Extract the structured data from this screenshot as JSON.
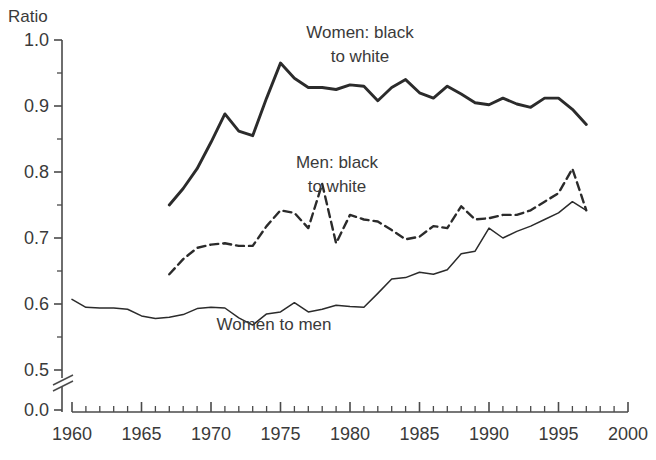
{
  "chart_data": {
    "type": "line",
    "title": "",
    "subtitle": "",
    "xlabel": "",
    "ylabel": "Ratio",
    "xlim": [
      1960,
      2000
    ],
    "ylim": [
      0.5,
      1.0
    ],
    "y_axis_break": true,
    "y_break_below": 0.5,
    "y_origin_label": "0.0",
    "grid": false,
    "legend_position": "inline-annotations",
    "y_ticks": [
      "1.0",
      "0.9",
      "0.8",
      "0.7",
      "0.6",
      "0.5",
      "0.0"
    ],
    "y_tick_values": [
      1.0,
      0.9,
      0.8,
      0.7,
      0.6,
      0.5,
      0.0
    ],
    "y_minor_tick_values": [
      0.95,
      0.85,
      0.75,
      0.65,
      0.55
    ],
    "x_ticks": [
      "1960",
      "1965",
      "1970",
      "1975",
      "1980",
      "1985",
      "1990",
      "1995",
      "2000"
    ],
    "x_tick_values": [
      1960,
      1965,
      1970,
      1975,
      1980,
      1985,
      1990,
      1995,
      2000
    ],
    "x_minor_tick_step": 1,
    "series": [
      {
        "name": "Women: black to white",
        "style": "solid-thick",
        "color": "#2b2b2b",
        "label_line1": "Women: black",
        "label_line2": "to white",
        "x": [
          1967,
          1968,
          1969,
          1970,
          1971,
          1972,
          1973,
          1974,
          1975,
          1976,
          1977,
          1978,
          1979,
          1980,
          1981,
          1982,
          1983,
          1984,
          1985,
          1986,
          1987,
          1988,
          1989,
          1990,
          1991,
          1992,
          1993,
          1994,
          1995,
          1996,
          1997
        ],
        "values": [
          0.75,
          0.775,
          0.805,
          0.845,
          0.888,
          0.862,
          0.855,
          0.912,
          0.965,
          0.942,
          0.928,
          0.928,
          0.925,
          0.932,
          0.93,
          0.908,
          0.928,
          0.94,
          0.92,
          0.912,
          0.93,
          0.918,
          0.905,
          0.902,
          0.912,
          0.903,
          0.898,
          0.912,
          0.912,
          0.895,
          0.872
        ]
      },
      {
        "name": "Men: black to white",
        "style": "dashed",
        "color": "#2b2b2b",
        "label_line1": "Men: black",
        "label_line2": "to white",
        "x": [
          1967,
          1968,
          1969,
          1970,
          1971,
          1972,
          1973,
          1974,
          1975,
          1976,
          1977,
          1978,
          1979,
          1980,
          1981,
          1982,
          1983,
          1984,
          1985,
          1986,
          1987,
          1988,
          1989,
          1990,
          1991,
          1992,
          1993,
          1994,
          1995,
          1996,
          1997
        ],
        "values": [
          0.645,
          0.668,
          0.685,
          0.69,
          0.692,
          0.688,
          0.688,
          0.718,
          0.742,
          0.738,
          0.715,
          0.782,
          0.692,
          0.735,
          0.728,
          0.725,
          0.712,
          0.698,
          0.702,
          0.718,
          0.715,
          0.748,
          0.728,
          0.73,
          0.735,
          0.735,
          0.742,
          0.755,
          0.768,
          0.805,
          0.742
        ]
      },
      {
        "name": "Women to men",
        "style": "solid-thin",
        "color": "#2b2b2b",
        "label_line1": "Women to men",
        "label_line2": "",
        "x": [
          1960,
          1961,
          1962,
          1963,
          1964,
          1965,
          1966,
          1967,
          1968,
          1969,
          1970,
          1971,
          1972,
          1973,
          1974,
          1975,
          1976,
          1977,
          1978,
          1979,
          1980,
          1981,
          1982,
          1983,
          1984,
          1985,
          1986,
          1987,
          1988,
          1989,
          1990,
          1991,
          1992,
          1993,
          1994,
          1995,
          1996,
          1997
        ],
        "values": [
          0.607,
          0.595,
          0.594,
          0.594,
          0.592,
          0.582,
          0.578,
          0.58,
          0.584,
          0.593,
          0.595,
          0.594,
          0.579,
          0.568,
          0.585,
          0.588,
          0.602,
          0.588,
          0.592,
          0.598,
          0.596,
          0.595,
          0.616,
          0.638,
          0.64,
          0.648,
          0.645,
          0.652,
          0.676,
          0.68,
          0.715,
          0.7,
          0.71,
          0.718,
          0.728,
          0.738,
          0.755,
          0.742
        ]
      }
    ]
  },
  "annotations": [
    {
      "id": "women-black-white",
      "line1": "Women: black",
      "line2": "to white",
      "x": 360,
      "y": 38
    },
    {
      "id": "men-black-white",
      "line1": "Men: black",
      "line2": "to white",
      "x": 337,
      "y": 168
    },
    {
      "id": "women-to-men",
      "line1": "Women to men",
      "line2": "",
      "x": 274,
      "y": 330
    }
  ],
  "axis": {
    "y_title": "Ratio"
  },
  "colors": {
    "line": "#2b2b2b",
    "axis": "#4a4a4a",
    "text": "#3a3a3a",
    "background": "#ffffff"
  }
}
